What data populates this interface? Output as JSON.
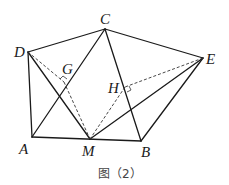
{
  "figure": {
    "caption": "图（2）",
    "points": {
      "A": {
        "label": "A",
        "x": 32,
        "y": 137
      },
      "B": {
        "label": "B",
        "x": 141,
        "y": 141
      },
      "C": {
        "label": "C",
        "x": 105,
        "y": 29
      },
      "D": {
        "label": "D",
        "x": 28,
        "y": 52
      },
      "E": {
        "label": "E",
        "x": 203,
        "y": 58
      },
      "M": {
        "label": "M",
        "x": 90,
        "y": 139
      },
      "G": {
        "label": "G",
        "x": 64,
        "y": 82
      },
      "H": {
        "label": "H",
        "x": 125,
        "y": 87
      }
    },
    "solid_segments": [
      "DC",
      "CE",
      "DA",
      "AM",
      "MB",
      "AC",
      "DM",
      "CB",
      "EM",
      "EB"
    ],
    "dashed_segments": [
      "DG",
      "GM",
      "EH",
      "HM"
    ],
    "right_angles": [
      "G",
      "H"
    ],
    "colors": {
      "line": "#1a1a1a",
      "caption": "#444444"
    }
  }
}
